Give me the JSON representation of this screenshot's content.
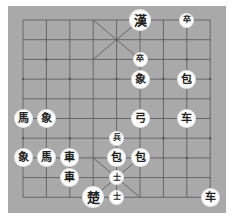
{
  "caption": "",
  "board": {
    "background": "#a9a9a9",
    "line_color": "#555555",
    "cols": 9,
    "rows": 10,
    "origin_x": 23,
    "origin_y": 20,
    "step_x": 23.4,
    "step_y": 19.7
  },
  "pieces": [
    {
      "glyph": "漢",
      "col": 5,
      "row": 0,
      "size": "large"
    },
    {
      "glyph": "卒",
      "col": 7,
      "row": 0,
      "size": "small"
    },
    {
      "glyph": "卒",
      "col": 5,
      "row": 2,
      "size": "small"
    },
    {
      "glyph": "象",
      "col": 5,
      "row": 3,
      "size": "normal"
    },
    {
      "glyph": "包",
      "col": 7,
      "row": 3,
      "size": "normal"
    },
    {
      "glyph": "馬",
      "col": 0,
      "row": 5,
      "size": "normal"
    },
    {
      "glyph": "象",
      "col": 1,
      "row": 5,
      "size": "normal"
    },
    {
      "glyph": "弓",
      "col": 5,
      "row": 5,
      "size": "normal"
    },
    {
      "glyph": "车",
      "col": 7,
      "row": 5,
      "size": "normal"
    },
    {
      "glyph": "兵",
      "col": 4,
      "row": 6,
      "size": "small"
    },
    {
      "glyph": "象",
      "col": 0,
      "row": 7,
      "size": "normal"
    },
    {
      "glyph": "馬",
      "col": 1,
      "row": 7,
      "size": "normal"
    },
    {
      "glyph": "車",
      "col": 2,
      "row": 7,
      "size": "normal"
    },
    {
      "glyph": "包",
      "col": 4,
      "row": 7,
      "size": "normal"
    },
    {
      "glyph": "包",
      "col": 5,
      "row": 7,
      "size": "normal"
    },
    {
      "glyph": "車",
      "col": 2,
      "row": 8,
      "size": "normal"
    },
    {
      "glyph": "士",
      "col": 4,
      "row": 8,
      "size": "small"
    },
    {
      "glyph": "楚",
      "col": 3,
      "row": 9,
      "size": "large"
    },
    {
      "glyph": "士",
      "col": 4,
      "row": 9,
      "size": "small"
    },
    {
      "glyph": "车",
      "col": 8,
      "row": 9,
      "size": "normal"
    }
  ]
}
